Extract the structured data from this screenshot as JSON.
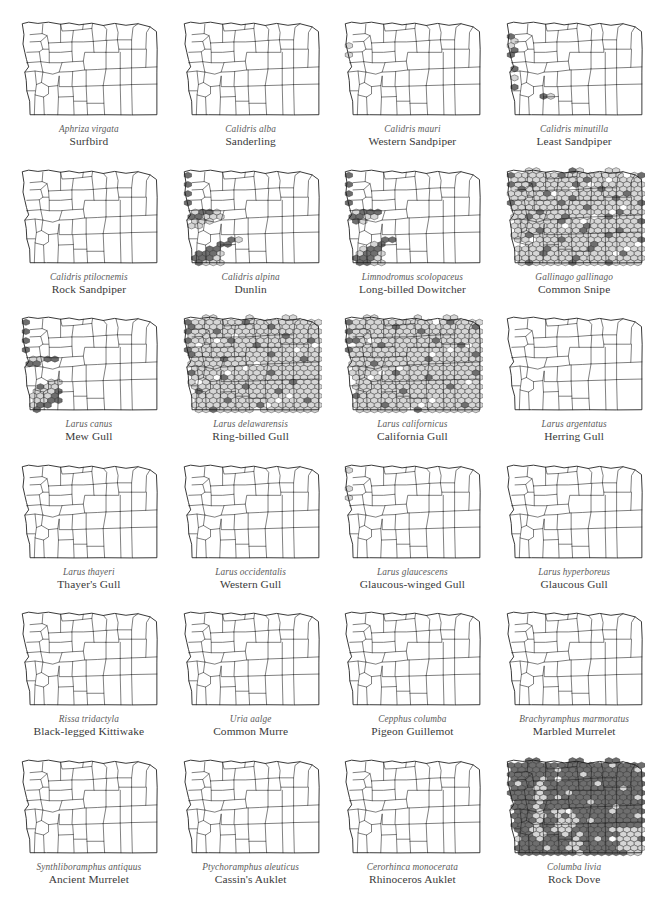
{
  "figure": {
    "layout": {
      "columns": 4,
      "rows": 6,
      "total_panels": 24
    },
    "colors": {
      "background": "#ffffff",
      "map_outline": "#1a1a1a",
      "county_line": "#1a1a1a",
      "hex_dark": "#6e6e6e",
      "hex_light": "#d6d6d6",
      "hex_stroke": "#2b2b2b",
      "scientific_name_text": "#5b5b5b",
      "common_name_text": "#3a3a3a"
    },
    "symbology": {
      "hex_dark_label": "dark hexagon",
      "hex_light_label": "light hexagon"
    },
    "panels": [
      {
        "scientific_name": "Aphriza virgata",
        "common_name": "Surfbird",
        "pattern": "coast",
        "dark_ratio": 1.0
      },
      {
        "scientific_name": "Calidris alba",
        "common_name": "Sanderling",
        "pattern": "coast",
        "dark_ratio": 1.0
      },
      {
        "scientific_name": "Calidris mauri",
        "common_name": "Western Sandpiper",
        "pattern": "coast-wide",
        "dark_ratio": 0.62
      },
      {
        "scientific_name": "Calidris minutilla",
        "common_name": "Least Sandpiper",
        "pattern": "coast-wide-spot",
        "dark_ratio": 0.66
      },
      {
        "scientific_name": "Calidris ptilocnemis",
        "common_name": "Rock Sandpiper",
        "pattern": "coast",
        "dark_ratio": 0.9
      },
      {
        "scientific_name": "Calidris alpina",
        "common_name": "Dunlin",
        "pattern": "coast-valley",
        "dark_ratio": 0.82
      },
      {
        "scientific_name": "Limnodromus scolopaceus",
        "common_name": "Long-billed Dowitcher",
        "pattern": "coast-valley",
        "dark_ratio": 0.72
      },
      {
        "scientific_name": "Gallinago gallinago",
        "common_name": "Common Snipe",
        "pattern": "statewide",
        "dark_ratio": 0.4
      },
      {
        "scientific_name": "Larus canus",
        "common_name": "Mew Gull",
        "pattern": "coast-valley",
        "dark_ratio": 0.78
      },
      {
        "scientific_name": "Larus delawarensis",
        "common_name": "Ring-billed Gull",
        "pattern": "statewide",
        "dark_ratio": 0.22
      },
      {
        "scientific_name": "Larus californicus",
        "common_name": "California Gull",
        "pattern": "statewide",
        "dark_ratio": 0.2
      },
      {
        "scientific_name": "Larus argentatus",
        "common_name": "Herring Gull",
        "pattern": "coast-sparse",
        "dark_ratio": 0.85
      },
      {
        "scientific_name": "Larus thayeri",
        "common_name": "Thayer's Gull",
        "pattern": "coast",
        "dark_ratio": 0.95
      },
      {
        "scientific_name": "Larus occidentalis",
        "common_name": "Western Gull",
        "pattern": "coast",
        "dark_ratio": 0.97
      },
      {
        "scientific_name": "Larus glaucescens",
        "common_name": "Glaucous-winged Gull",
        "pattern": "coast-wide",
        "dark_ratio": 0.7
      },
      {
        "scientific_name": "Larus hyperboreus",
        "common_name": "Glaucous Gull",
        "pattern": "coast-sparse",
        "dark_ratio": 0.88
      },
      {
        "scientific_name": "Rissa tridactyla",
        "common_name": "Black-legged Kittiwake",
        "pattern": "coast",
        "dark_ratio": 1.0
      },
      {
        "scientific_name": "Uria aalge",
        "common_name": "Common Murre",
        "pattern": "coast",
        "dark_ratio": 1.0
      },
      {
        "scientific_name": "Cepphus columba",
        "common_name": "Pigeon Guillemot",
        "pattern": "coast-light",
        "dark_ratio": 0.3
      },
      {
        "scientific_name": "Brachyramphus marmoratus",
        "common_name": "Marbled Murrelet",
        "pattern": "coast-light",
        "dark_ratio": 0.35
      },
      {
        "scientific_name": "Synthliboramphus antiquus",
        "common_name": "Ancient Murrelet",
        "pattern": "coast",
        "dark_ratio": 1.0
      },
      {
        "scientific_name": "Ptychoramphus aleuticus",
        "common_name": "Cassin's Auklet",
        "pattern": "coast-light",
        "dark_ratio": 0.45
      },
      {
        "scientific_name": "Cerorhinca monocerata",
        "common_name": "Rhinoceros Auklet",
        "pattern": "coast-light",
        "dark_ratio": 0.4
      },
      {
        "scientific_name": "Columba livia",
        "common_name": "Rock Dove",
        "pattern": "dense",
        "dark_ratio": 0.86
      }
    ]
  }
}
